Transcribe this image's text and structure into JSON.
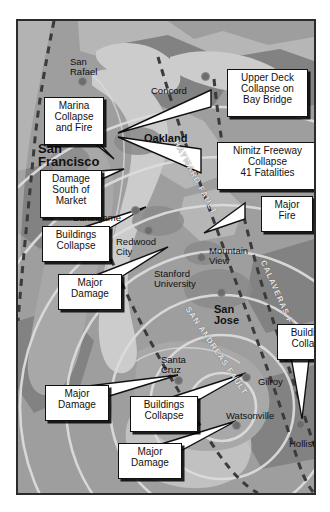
{
  "map": {
    "title": "Loma Prieta Earthquake Damage Map",
    "colors": {
      "frame_border": "#2b2b2b",
      "water": "#c9c9c9",
      "land_base": "#9e9e9e",
      "land_light": "#b4b4b4",
      "land_dark": "#7f7f7f",
      "urban": "#8e8e8e",
      "ring": "#d8d8d8",
      "fault_dash": "#3a3a3a",
      "callout_bg": "#ffffff",
      "callout_border": "#111111",
      "text": "#111111"
    },
    "cities": [
      {
        "name": "San\nRafael",
        "x": 52,
        "y": 36,
        "size": "sm",
        "dot_x": 64,
        "dot_y": 60
      },
      {
        "name": "Concord",
        "x": 133,
        "y": 65,
        "size": "sm",
        "dot_x": 187,
        "dot_y": 55
      },
      {
        "name": "San\nFrancisco",
        "x": 20,
        "y": 121,
        "size": "big",
        "dot_x": null,
        "dot_y": null
      },
      {
        "name": "Oakland",
        "x": 126,
        "y": 112,
        "size": "mid",
        "dot_x": null,
        "dot_y": null
      },
      {
        "name": "Burlingame",
        "x": 55,
        "y": 192,
        "size": "sm",
        "dot_x": 117,
        "dot_y": 189
      },
      {
        "name": "Redwood\nCity",
        "x": 98,
        "y": 216,
        "size": "sm",
        "dot_x": 130,
        "dot_y": 209
      },
      {
        "name": "Mountain\nView",
        "x": 191,
        "y": 225,
        "size": "sm",
        "dot_x": 183,
        "dot_y": 236
      },
      {
        "name": "Stanford\nUniversity",
        "x": 136,
        "y": 248,
        "size": "sm",
        "dot_x": null,
        "dot_y": null
      },
      {
        "name": "San\nJose",
        "x": 196,
        "y": 283,
        "size": "mid",
        "dot_x": 203,
        "dot_y": 271
      },
      {
        "name": "Santa\nCruz",
        "x": 143,
        "y": 334,
        "size": "sm",
        "dot_x": 160,
        "dot_y": 359
      },
      {
        "name": "Gilroy",
        "x": 240,
        "y": 356,
        "size": "sm",
        "dot_x": 228,
        "dot_y": 356
      },
      {
        "name": "Watsonville",
        "x": 208,
        "y": 390,
        "size": "sm",
        "dot_x": 218,
        "dot_y": 404
      },
      {
        "name": "Hollister",
        "x": 271,
        "y": 418,
        "size": "sm",
        "dot_x": 282,
        "dot_y": 403
      }
    ],
    "faults": [
      {
        "label": "HAYWARD FAULT",
        "x": 162,
        "y": 118,
        "rotate": 62
      },
      {
        "label": "CALAVERAS FAULT",
        "x": 249,
        "y": 238,
        "rotate": 66
      },
      {
        "label": "SAN ANDREAS FAULT",
        "x": 173,
        "y": 284,
        "rotate": 56
      }
    ],
    "callouts": [
      {
        "id": "marina",
        "text": "Marina\nCollapse\nand Fire",
        "x": 26,
        "y": 76,
        "w": 50,
        "h": 41
      },
      {
        "id": "upper-deck",
        "text": "Upper Deck\nCollapse on\nBay Bridge",
        "x": 209,
        "y": 48,
        "w": 71,
        "h": 41
      },
      {
        "id": "nimitz",
        "text": "Nimitz Freeway\nCollapse\n41 Fatalities",
        "x": 199,
        "y": 121,
        "w": 91,
        "h": 41
      },
      {
        "id": "damage-som",
        "text": "Damage\nSouth of\nMarket",
        "x": 22,
        "y": 149,
        "w": 52,
        "h": 41
      },
      {
        "id": "major-fire",
        "text": "Major\nFire",
        "x": 243,
        "y": 175,
        "w": 42,
        "h": 29
      },
      {
        "id": "buildings-1",
        "text": "Buildings\nCollapse",
        "x": 24,
        "y": 205,
        "w": 58,
        "h": 29
      },
      {
        "id": "major-damage-1",
        "text": "Major\nDamage",
        "x": 40,
        "y": 253,
        "w": 54,
        "h": 29
      },
      {
        "id": "buildings-2",
        "text": "Buildings\nCollapse",
        "x": 259,
        "y": 303,
        "w": 58,
        "h": 29
      },
      {
        "id": "major-damage-2",
        "text": "Major\nDamage",
        "x": 27,
        "y": 364,
        "w": 54,
        "h": 29
      },
      {
        "id": "buildings-3",
        "text": "Buildings\nCollapse",
        "x": 112,
        "y": 375,
        "w": 58,
        "h": 29
      },
      {
        "id": "major-damage-3",
        "text": "Major\nDamage",
        "x": 100,
        "y": 422,
        "w": 54,
        "h": 29
      }
    ]
  }
}
